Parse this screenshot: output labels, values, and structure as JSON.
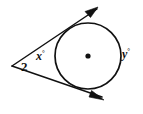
{
  "figure": {
    "background_color": "#ffffff",
    "stroke_color": "#111111",
    "labels": {
      "vertex_angle": "2",
      "near_arc": "x",
      "far_arc": "y",
      "degree_symbol": "°"
    }
  },
  "geometry": {
    "circle": {
      "center_x": 88,
      "center_y": 56,
      "radius": 33,
      "stroke_width": 1.7
    },
    "center_dot": {
      "x": 88,
      "y": 56,
      "radius": 2.6
    },
    "vertex": {
      "x": 12,
      "y": 66
    },
    "tangent_upper": {
      "from_x": 12,
      "from_y": 66,
      "to_x": 97,
      "to_y": 9,
      "stroke_width": 1.5
    },
    "tangent_lower": {
      "from_x": 12,
      "from_y": 66,
      "to_x": 102,
      "to_y": 98,
      "stroke_width": 1.5
    },
    "arrow_upper": {
      "points": "97,9 86,12 90,17"
    },
    "arrow_lower": {
      "points": "103,99 90,97 92,91"
    }
  }
}
